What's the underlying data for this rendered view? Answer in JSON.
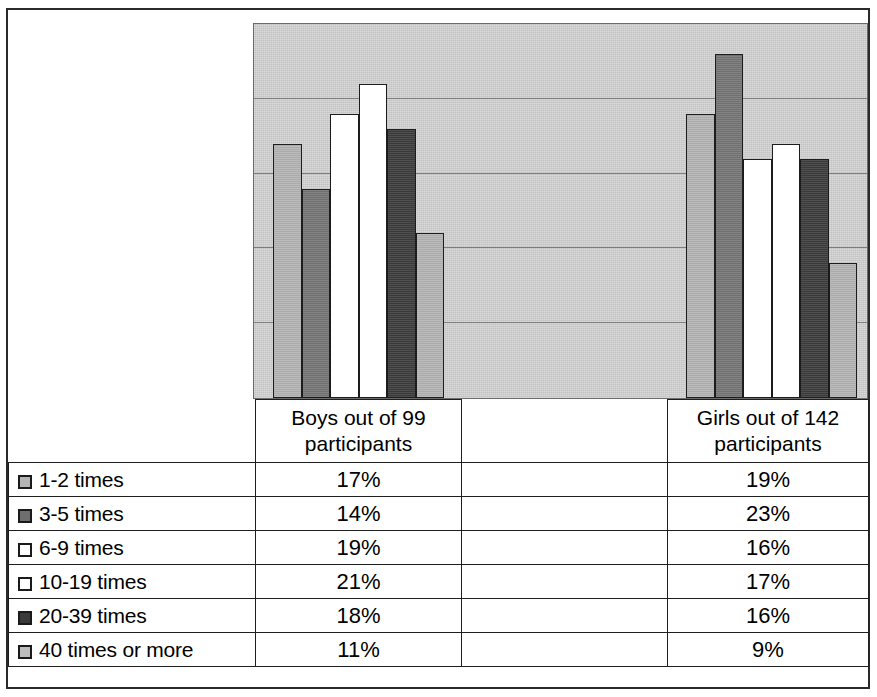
{
  "chart_data": {
    "type": "bar",
    "title": "",
    "subtitle": "",
    "xlabel": "",
    "ylabel": "",
    "grid": true,
    "gridlines": 4,
    "ylim": [
      0,
      25
    ],
    "legend_position": "table-left-column",
    "categories": [
      "Boys out of 99 participants",
      "Girls out of 142 participants"
    ],
    "series": [
      {
        "name": "1-2 times",
        "values": [
          17,
          19
        ],
        "color": "#b4b4b4"
      },
      {
        "name": "3-5 times",
        "values": [
          14,
          23
        ],
        "color": "#757575"
      },
      {
        "name": "6-9 times",
        "values": [
          19,
          16
        ],
        "color": "#ffffff"
      },
      {
        "name": "10-19 times",
        "values": [
          21,
          17
        ],
        "color": "#ffffff"
      },
      {
        "name": "20-39 times",
        "values": [
          18,
          16
        ],
        "color": "#3c3c3c"
      },
      {
        "name": "40 times or more",
        "values": [
          11,
          9
        ],
        "color": "#b4b4b4"
      }
    ]
  },
  "table": {
    "header": {
      "legend_blank": "",
      "boys": "Boys out of 99 participants",
      "boys_line1": "Boys out of 99",
      "boys_line2": "participants",
      "gap": "",
      "girls": "Girls out of 142 participants",
      "girls_line1": "Girls out of 142",
      "girls_line2": "participants"
    },
    "rows": [
      {
        "label": "1-2 times",
        "swatch": "#b4b4b4",
        "boys": "17%",
        "gap": "",
        "girls": "19%"
      },
      {
        "label": "3-5 times",
        "swatch": "#6e6e6e",
        "boys": "14%",
        "gap": "",
        "girls": "23%"
      },
      {
        "label": "6-9 times",
        "swatch": "#ffffff",
        "boys": "19%",
        "gap": "",
        "girls": "16%"
      },
      {
        "label": "10-19 times",
        "swatch": "#ffffff",
        "boys": "21%",
        "gap": "",
        "girls": "17%"
      },
      {
        "label": "20-39 times",
        "swatch": "#3a3a3a",
        "boys": "18%",
        "gap": "",
        "girls": "16%"
      },
      {
        "label": "40 times or more",
        "swatch": "#bdbdbd",
        "boys": "11%",
        "gap": "",
        "girls": "9%"
      }
    ]
  },
  "colors": {
    "plot_background": "#d2d2d2",
    "gridline": "#7d7d7d",
    "bar_outline": "#1c1c1c",
    "table_border": "#1f1f1f",
    "page_border": "#2a2a2a"
  }
}
